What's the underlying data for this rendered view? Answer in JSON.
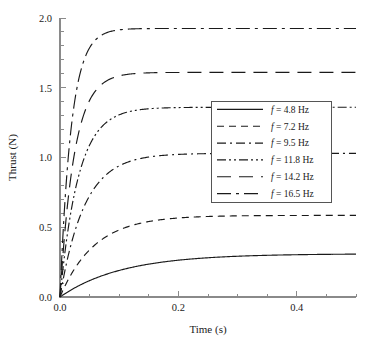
{
  "chart_data": {
    "type": "line",
    "title": "",
    "xlabel": "Time (s)",
    "ylabel": "Thrust (N)",
    "xlim": [
      0.0,
      0.5
    ],
    "ylim": [
      0.0,
      2.0
    ],
    "xticks": [
      0.0,
      0.2,
      0.4
    ],
    "xtick_labels": [
      "0.0",
      "0.2",
      "0.4"
    ],
    "x_minor_step": 0.05,
    "yticks": [
      0.0,
      0.5,
      1.0,
      1.5,
      2.0
    ],
    "ytick_labels": [
      "0.0",
      "0.5",
      "1.0",
      "1.5",
      "2.0"
    ],
    "y_minor_step": 0.1,
    "grid": false,
    "legend_position": "center-right",
    "legend_border": true,
    "line_color": "#1a1a1a",
    "series": [
      {
        "name": "f = 4.8 Hz",
        "freq": 4.8,
        "plateau": 0.31,
        "tau": 0.105,
        "dash": "solid",
        "dasharray": ""
      },
      {
        "name": "f = 7.2 Hz",
        "freq": 7.2,
        "plateau": 0.585,
        "tau": 0.058,
        "dash": "dashed",
        "dasharray": "7,5"
      },
      {
        "name": "f = 9.5 Hz",
        "freq": 9.5,
        "plateau": 1.03,
        "tau": 0.041,
        "dash": "dash-dot",
        "dasharray": "9,4,2,4"
      },
      {
        "name": "f = 11.8 Hz",
        "freq": 11.8,
        "plateau": 1.36,
        "tau": 0.031,
        "dash": "dash-dot-dot",
        "dasharray": "9,3,2,3,2,3"
      },
      {
        "name": "f = 14.2 Hz",
        "freq": 14.2,
        "plateau": 1.61,
        "tau": 0.024,
        "dash": "long-dash",
        "dasharray": "14,8"
      },
      {
        "name": "f = 16.5 Hz",
        "freq": 16.5,
        "plateau": 1.925,
        "tau": 0.019,
        "dash": "long-dash-dot",
        "dasharray": "14,5,3,5"
      }
    ],
    "legend_entries": [
      {
        "prefix": "f",
        "rest": " = 4.8 Hz"
      },
      {
        "prefix": "f",
        "rest": " = 7.2 Hz"
      },
      {
        "prefix": "f",
        "rest": " = 9.5 Hz"
      },
      {
        "prefix": "f",
        "rest": " = 11.8 Hz"
      },
      {
        "prefix": "f",
        "rest": " = 14.2 Hz"
      },
      {
        "prefix": "f",
        "rest": " = 16.5 Hz"
      }
    ]
  },
  "axes": {
    "x_axis_name": "Time (s)",
    "y_axis_name": "Thrust (N)"
  }
}
